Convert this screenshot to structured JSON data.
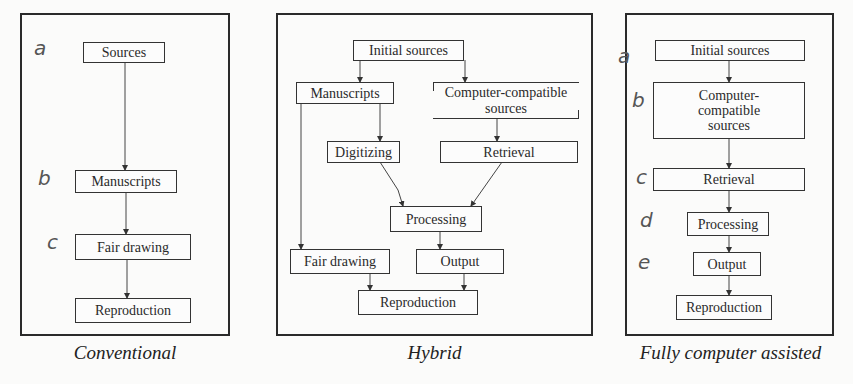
{
  "panels": [
    {
      "id": "conventional",
      "caption": "Conventional",
      "nodes": [
        "Sources",
        "Manuscripts",
        "Fair drawing",
        "Reproduction"
      ],
      "annotations": [
        "a",
        "b",
        "c"
      ]
    },
    {
      "id": "hybrid",
      "caption": "Hybrid",
      "nodes": {
        "initial_sources": "Initial sources",
        "manuscripts": "Manuscripts",
        "computer_compatible": "Computer-compatible sources",
        "digitizing": "Digitizing",
        "retrieval": "Retrieval",
        "processing": "Processing",
        "fair_drawing": "Fair drawing",
        "output": "Output",
        "reproduction": "Reproduction"
      }
    },
    {
      "id": "fully-computer-assisted",
      "caption": "Fully computer assisted",
      "nodes": [
        "Initial sources",
        "Computer-compatible sources",
        "Retrieval",
        "Processing",
        "Output",
        "Reproduction"
      ],
      "annotations": [
        "a",
        "b",
        "c",
        "d",
        "e"
      ]
    }
  ],
  "edges": {
    "conventional": [
      [
        "Sources",
        "Manuscripts"
      ],
      [
        "Manuscripts",
        "Fair drawing"
      ],
      [
        "Fair drawing",
        "Reproduction"
      ]
    ],
    "hybrid": [
      [
        "Initial sources",
        "Manuscripts"
      ],
      [
        "Initial sources",
        "Computer-compatible sources"
      ],
      [
        "Manuscripts",
        "Digitizing"
      ],
      [
        "Manuscripts",
        "Fair drawing"
      ],
      [
        "Computer-compatible sources",
        "Retrieval"
      ],
      [
        "Digitizing",
        "Processing"
      ],
      [
        "Retrieval",
        "Processing"
      ],
      [
        "Processing",
        "Output"
      ],
      [
        "Fair drawing",
        "Reproduction"
      ],
      [
        "Output",
        "Reproduction"
      ]
    ],
    "fully-computer-assisted": [
      [
        "Initial sources",
        "Computer-compatible sources"
      ],
      [
        "Computer-compatible sources",
        "Retrieval"
      ],
      [
        "Retrieval",
        "Processing"
      ],
      [
        "Processing",
        "Output"
      ],
      [
        "Output",
        "Reproduction"
      ]
    ]
  }
}
